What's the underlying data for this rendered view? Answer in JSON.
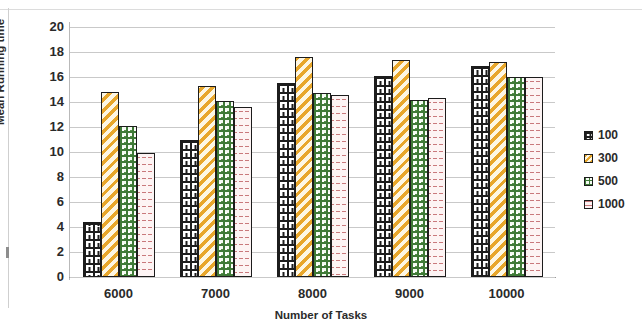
{
  "chart_data": {
    "type": "bar",
    "title": "",
    "xlabel": "Number of Tasks",
    "ylabel": "Mean Running time",
    "categories": [
      "6000",
      "7000",
      "8000",
      "9000",
      "10000"
    ],
    "series": [
      {
        "name": "100",
        "values": [
          4.4,
          11.0,
          15.5,
          16.1,
          16.9
        ],
        "color": "#1d1d1d",
        "pattern": "brick"
      },
      {
        "name": "300",
        "values": [
          14.8,
          15.3,
          17.6,
          17.4,
          17.2
        ],
        "color": "#e8a72c",
        "pattern": "diagonal-stripes"
      },
      {
        "name": "500",
        "values": [
          12.1,
          14.1,
          14.7,
          14.2,
          16.0
        ],
        "color": "#3f7a37",
        "pattern": "checker"
      },
      {
        "name": "1000",
        "values": [
          9.9,
          13.6,
          14.6,
          14.3,
          16.0
        ],
        "color": "#c9797c",
        "pattern": "dashes"
      }
    ],
    "ylim": [
      0,
      20
    ],
    "yticks": [
      "0",
      "2",
      "4",
      "6",
      "8",
      "10",
      "12",
      "14",
      "16",
      "18",
      "20"
    ],
    "grid": true,
    "legend_position": "right",
    "legend_entries": [
      "100",
      "300",
      "500",
      "1000"
    ]
  },
  "axes": {
    "y_title": "Mean Running time",
    "x_title": "Number of Tasks"
  }
}
